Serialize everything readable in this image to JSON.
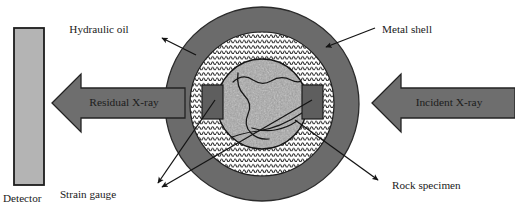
{
  "figure": {
    "background_color": "#ffffff",
    "width": 515,
    "height": 219
  },
  "colors": {
    "metal_shell": "#6b6b6b",
    "metal_shell_stroke": "#2b2b2b",
    "hydraulic_oil_bg": "#ffffff",
    "hydraulic_oil_wave": "#1f1f1f",
    "rock_base": "#9a9a9a",
    "rock_speckle_dark": "#6a6a6a",
    "rock_speckle_light": "#c4c4c4",
    "crack_line": "#161616",
    "strain_gauge": "#5e5e5e",
    "strain_gauge_stroke": "#1d1d1d",
    "detector_fill": "#b4b4b4",
    "detector_stroke": "#1c1c1c",
    "arrow_fill": "#6e6e6e",
    "arrow_stroke": "#232323",
    "leader_line": "#141414",
    "text": "#1a1a1a"
  },
  "detector": {
    "label": "Detector",
    "rect": {
      "x": 14,
      "y": 28,
      "width": 30,
      "height": 157
    },
    "label_pos": {
      "x": 3,
      "y": 199
    }
  },
  "arrows": [
    {
      "name": "residual-xray-arrow",
      "label": "Residual X-ray",
      "direction": "left",
      "label_pos": {
        "x": 124,
        "y": 103
      },
      "tip": {
        "x": 52,
        "y": 103
      },
      "tail": {
        "x": 185,
        "y": 103
      },
      "head_half_height": 29,
      "shaft_half_height": 15
    },
    {
      "name": "incident-xray-arrow",
      "label": "Incident X-ray",
      "direction": "left",
      "label_pos": {
        "x": 449,
        "y": 103
      },
      "tip": {
        "x": 372,
        "y": 103
      },
      "tail": {
        "x": 515,
        "y": 103
      },
      "head_half_height": 29,
      "shaft_half_height": 15
    }
  ],
  "cell": {
    "center": {
      "x": 262,
      "y": 104
    },
    "metal_shell_radius": 97,
    "hydraulic_oil_radius": 72,
    "rock_radius": 45
  },
  "strain_gauges": [
    {
      "name": "strain-gauge-left",
      "x": 202,
      "y": 85,
      "width": 21,
      "height": 34
    },
    {
      "name": "strain-gauge-right",
      "x": 302,
      "y": 85,
      "width": 21,
      "height": 34
    }
  ],
  "labels": [
    {
      "name": "hydraulic-oil",
      "text": "Hydraulic oil",
      "text_pos": {
        "x": 99,
        "y": 30
      },
      "leader": {
        "x1": 196,
        "y1": 55,
        "x2": 162,
        "y2": 38
      }
    },
    {
      "name": "metal-shell",
      "text": "Metal shell",
      "text_pos": {
        "x": 382,
        "y": 30
      },
      "leader": {
        "x1": 326,
        "y1": 47,
        "x2": 375,
        "y2": 28
      }
    },
    {
      "name": "strain-gauge",
      "text": "Strain gauge",
      "text_pos": {
        "x": 88,
        "y": 195
      },
      "leader": {
        "x1": 215,
        "y1": 100,
        "x2": 158,
        "y2": 183
      },
      "leader2": {
        "x1": 312,
        "y1": 100,
        "x2": 162,
        "y2": 187
      }
    },
    {
      "name": "rock-specimen",
      "text": "Rock specimen",
      "text_pos": {
        "x": 392,
        "y": 186
      },
      "leader": {
        "x1": 295,
        "y1": 120,
        "x2": 378,
        "y2": 180
      }
    }
  ]
}
